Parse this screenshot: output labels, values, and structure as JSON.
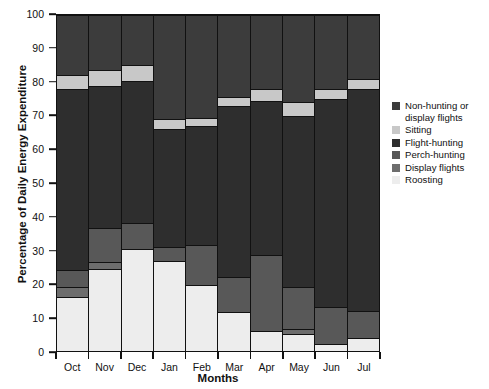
{
  "chart_data": {
    "type": "bar",
    "subtype": "stacked-bar-100",
    "title": "",
    "xlabel": "Months",
    "ylabel": "Percentage of Daily Energy Expenditure",
    "ylim": [
      0,
      100
    ],
    "yticks": [
      0,
      10,
      20,
      30,
      40,
      50,
      60,
      70,
      80,
      90,
      100
    ],
    "grid": false,
    "legend_position": "right",
    "categories": [
      "Oct",
      "Nov",
      "Dec",
      "Jan",
      "Feb",
      "Mar",
      "Apr",
      "May",
      "Jun",
      "Jul"
    ],
    "series": [
      {
        "name": "Roosting",
        "color": "#ededed",
        "values": [
          16.0,
          24.5,
          30.5,
          26.8,
          19.7,
          11.5,
          6.0,
          5.0,
          2.0,
          4.0
        ]
      },
      {
        "name": "Display flights",
        "color": "#6d6d6d",
        "values": [
          3.0,
          2.0,
          0.0,
          0.0,
          0.0,
          0.0,
          0.0,
          1.5,
          0.0,
          0.0
        ]
      },
      {
        "name": "Perch-hunting",
        "color": "#585858",
        "values": [
          5.0,
          10.0,
          7.5,
          4.3,
          12.0,
          10.5,
          22.5,
          12.5,
          11.0,
          8.0
        ]
      },
      {
        "name": "Flight-hunting",
        "color": "#2e2e2e",
        "values": [
          54.0,
          42.5,
          42.5,
          34.9,
          35.3,
          51.0,
          46.0,
          51.0,
          62.0,
          66.0
        ]
      },
      {
        "name": "Sitting",
        "color": "#c8c8c8",
        "values": [
          4.0,
          4.5,
          4.5,
          3.0,
          2.5,
          2.5,
          3.5,
          4.0,
          3.0,
          3.0
        ]
      },
      {
        "name": "Non-hunting or display flights",
        "color": "#3c3c3c",
        "values": [
          18.0,
          16.5,
          15.0,
          31.0,
          30.5,
          24.5,
          22.0,
          26.0,
          22.0,
          19.0
        ]
      }
    ]
  },
  "legend": {
    "items": [
      {
        "label": "Non-hunting or display flights",
        "color": "#3c3c3c"
      },
      {
        "label": "Sitting",
        "color": "#c8c8c8"
      },
      {
        "label": "Flight-hunting",
        "color": "#2e2e2e"
      },
      {
        "label": "Perch-hunting",
        "color": "#585858"
      },
      {
        "label": "Display flights",
        "color": "#6d6d6d"
      },
      {
        "label": "Roosting",
        "color": "#ededed"
      }
    ]
  },
  "axes": {
    "y_title": "Percentage of Daily Energy Expenditure",
    "x_title": "Months"
  }
}
